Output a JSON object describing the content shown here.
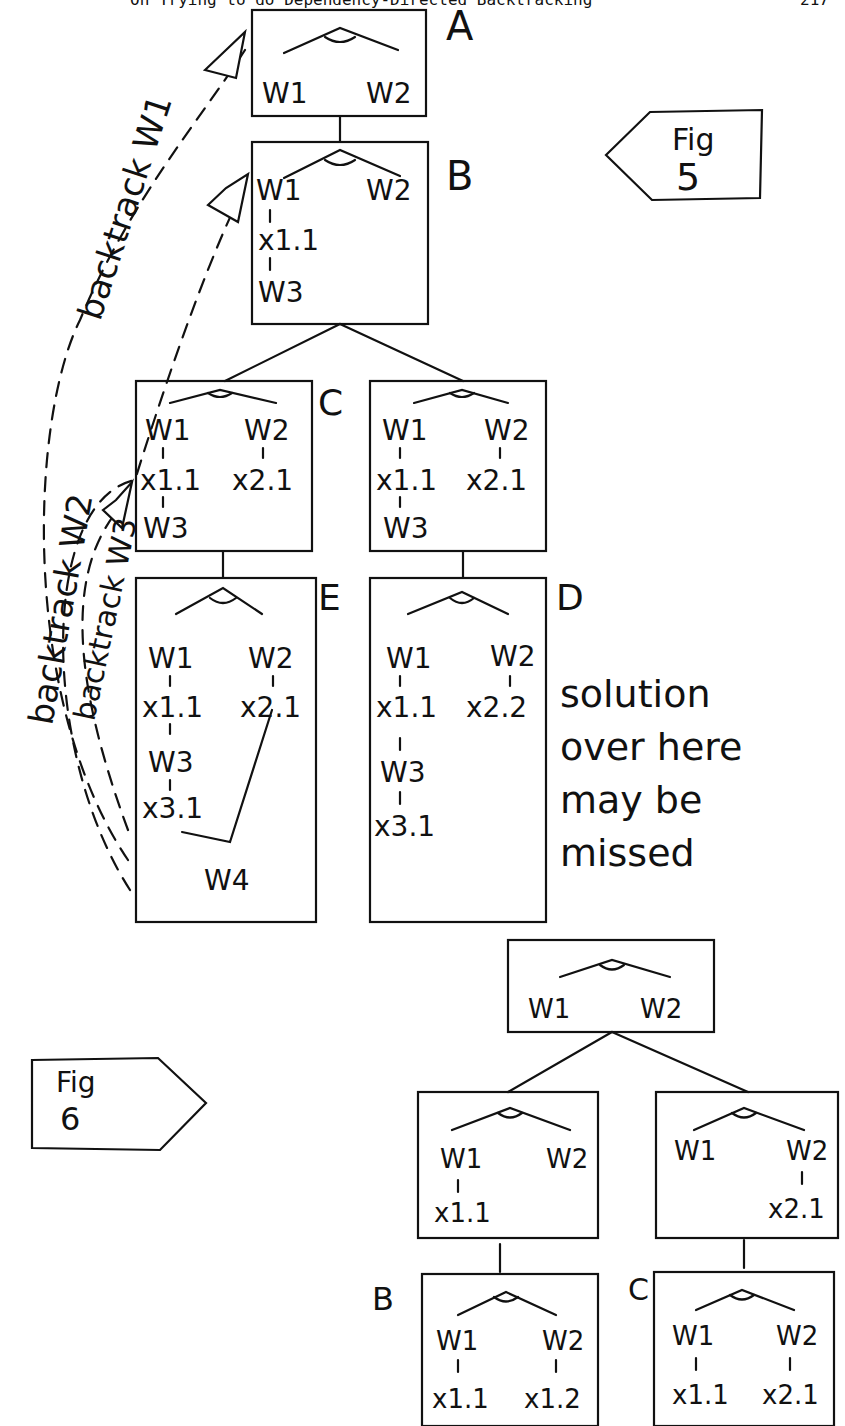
{
  "header": {
    "title": "On Trying to do Dependency-Directed Backtracking",
    "page": "217"
  },
  "fig5": {
    "label_prefix": "Fig",
    "label_num": "5",
    "nodes": {
      "A": {
        "label": "A",
        "left": "W1",
        "right": "W2"
      },
      "B": {
        "label": "B",
        "left": "W1",
        "right": "W2",
        "chain": [
          "x1.1",
          "W3"
        ]
      },
      "C": {
        "label": "C",
        "left": "W1",
        "right": "W2",
        "left_chain": [
          "x1.1",
          "W3"
        ],
        "right_chain": [
          "x2.1"
        ]
      },
      "C2": {
        "left": "W1",
        "right": "W2",
        "left_chain": [
          "x1.1",
          "W3"
        ],
        "right_chain": [
          "x2.1"
        ]
      },
      "E": {
        "label": "E",
        "left": "W1",
        "right": "W2",
        "left_chain": [
          "x1.1",
          "W3",
          "x3.1"
        ],
        "right_chain": [
          "x2.1"
        ],
        "join": "W4"
      },
      "D": {
        "label": "D",
        "left": "W1",
        "right": "W2",
        "left_chain": [
          "x1.1",
          "W3",
          "x3.1"
        ],
        "right_chain": [
          "x2.2"
        ]
      }
    },
    "arrows": [
      "backtrack W1",
      "backtrack W2",
      "backtrack W3"
    ],
    "note": [
      "solution",
      "over here",
      "may be",
      "missed"
    ]
  },
  "fig6": {
    "label_prefix": "Fig",
    "label_num": "6",
    "nodes": {
      "root": {
        "left": "W1",
        "right": "W2"
      },
      "L": {
        "left": "W1",
        "right": "W2",
        "left_chain": [
          "x1.1"
        ]
      },
      "R": {
        "left": "W1",
        "right": "W2",
        "right_chain": [
          "x2.1"
        ]
      },
      "B": {
        "label": "B",
        "left": "W1",
        "right": "W2",
        "left_chain": [
          "x1.1"
        ],
        "right_chain": [
          "x1.2"
        ]
      },
      "C": {
        "label": "C",
        "left": "W1",
        "right": "W2",
        "left_chain": [
          "x1.1"
        ],
        "right_chain": [
          "x2.1"
        ]
      }
    }
  }
}
